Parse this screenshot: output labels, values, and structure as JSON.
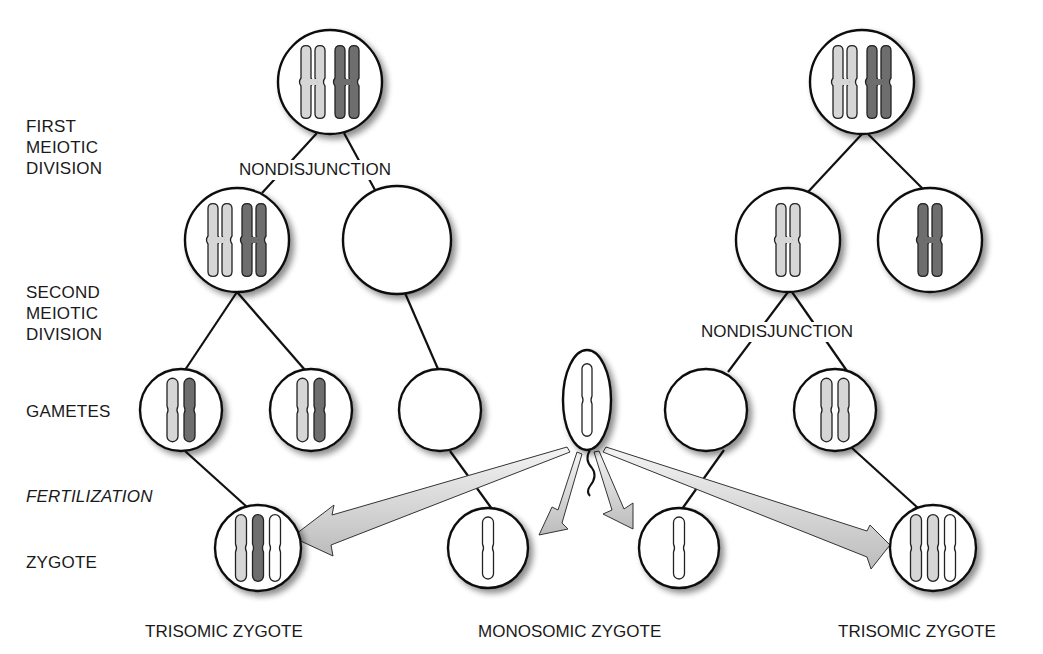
{
  "diagram": {
    "title": "",
    "colors": {
      "light_chromosome": "#d6d6d6",
      "dark_chromosome": "#6e6e6e",
      "white_chromosome": "#ffffff",
      "outline": "#111111",
      "arrow_fill": "#e9e9e9",
      "arrow_shade": "#a8a8a8"
    },
    "row_labels": {
      "first_meiotic": "FIRST\nMEIOTIC\nDIVISION",
      "second_meiotic": "SECOND\nMEIOTIC\nDIVISION",
      "gametes": "GAMETES",
      "fertilization": "FERTILIZATION",
      "zygote": "ZYGOTE"
    },
    "nondisjunction_labels": {
      "left": "NONDISJUNCTION",
      "right": "NONDISJUNCTION"
    },
    "captions": {
      "left": "TRISOMIC ZYGOTE",
      "center": "MONOSOMIC ZYGOTE",
      "right": "TRISOMIC ZYGOTE"
    },
    "nodes": [
      {
        "id": "left-parent",
        "cx": 330,
        "cy": 82,
        "r": 52,
        "content": [
          "X-light",
          "X-dark"
        ]
      },
      {
        "id": "left-m1-a",
        "cx": 237,
        "cy": 240,
        "r": 52,
        "content": [
          "X-light",
          "X-dark"
        ]
      },
      {
        "id": "left-m1-b",
        "cx": 397,
        "cy": 240,
        "r": 54,
        "content": []
      },
      {
        "id": "gamete-1",
        "cx": 181,
        "cy": 410,
        "r": 41,
        "content": [
          "I-light",
          "I-dark"
        ]
      },
      {
        "id": "gamete-2",
        "cx": 311,
        "cy": 410,
        "r": 41,
        "content": [
          "I-light",
          "I-dark"
        ]
      },
      {
        "id": "gamete-3",
        "cx": 440,
        "cy": 410,
        "r": 41,
        "content": []
      },
      {
        "id": "gamete-4",
        "cx": 706,
        "cy": 410,
        "r": 41,
        "content": []
      },
      {
        "id": "gamete-5",
        "cx": 835,
        "cy": 410,
        "r": 41,
        "content": [
          "I-light",
          "I-light"
        ]
      },
      {
        "id": "right-parent",
        "cx": 862,
        "cy": 82,
        "r": 52,
        "content": [
          "X-light",
          "X-dark"
        ]
      },
      {
        "id": "right-m1-a",
        "cx": 788,
        "cy": 240,
        "r": 52,
        "content": [
          "X-light"
        ]
      },
      {
        "id": "right-m1-b",
        "cx": 930,
        "cy": 240,
        "r": 52,
        "content": [
          "X-dark"
        ]
      },
      {
        "id": "zygote-1",
        "cx": 258,
        "cy": 548,
        "r": 43,
        "content": [
          "I-light",
          "I-dark",
          "I-white"
        ]
      },
      {
        "id": "zygote-2",
        "cx": 488,
        "cy": 548,
        "r": 40,
        "content": [
          "I-white"
        ]
      },
      {
        "id": "zygote-3",
        "cx": 679,
        "cy": 548,
        "r": 40,
        "content": [
          "I-white"
        ]
      },
      {
        "id": "zygote-4",
        "cx": 933,
        "cy": 548,
        "r": 43,
        "content": [
          "I-light",
          "I-light",
          "I-white"
        ]
      }
    ],
    "sperm": {
      "cx": 587,
      "cy": 400,
      "rx": 24,
      "ry": 50,
      "content": [
        "I-white"
      ]
    },
    "edges": [
      [
        "left-parent",
        "left-m1-a"
      ],
      [
        "left-parent",
        "left-m1-b"
      ],
      [
        "left-m1-a",
        "gamete-1"
      ],
      [
        "left-m1-a",
        "gamete-2"
      ],
      [
        "left-m1-b",
        "gamete-3"
      ],
      [
        "gamete-1",
        "zygote-1"
      ],
      [
        "gamete-3",
        "zygote-2"
      ],
      [
        "right-parent",
        "right-m1-a"
      ],
      [
        "right-parent",
        "right-m1-b"
      ],
      [
        "right-m1-a",
        "gamete-4"
      ],
      [
        "right-m1-a",
        "gamete-5"
      ],
      [
        "gamete-4",
        "zygote-3"
      ],
      [
        "gamete-5",
        "zygote-4"
      ]
    ],
    "arrows": [
      {
        "from": "sperm",
        "to": "zygote-1"
      },
      {
        "from": "sperm",
        "to": "zygote-2"
      },
      {
        "from": "sperm",
        "to": "zygote-3"
      },
      {
        "from": "sperm",
        "to": "zygote-4"
      }
    ]
  }
}
